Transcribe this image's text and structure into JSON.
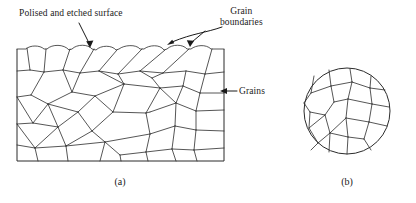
{
  "figure": {
    "stroke_color": "#2b2b2b",
    "text_color": "#1a1a1a",
    "background": "#ffffff"
  },
  "annotations": {
    "polished_surface": "Polised and etched surface",
    "grain_boundaries_line1": "Grain",
    "grain_boundaries_line2": "boundaries",
    "grains": "Grains"
  },
  "captions": {
    "a": "(a)",
    "b": "(b)"
  },
  "panels": {
    "a": {
      "shape": "rectangle",
      "x": 17,
      "y": 49,
      "width": 207,
      "height": 112,
      "grain_count": 58
    },
    "b": {
      "shape": "circle",
      "cx": 347,
      "cy": 111,
      "r": 43,
      "grain_count": 26
    }
  }
}
